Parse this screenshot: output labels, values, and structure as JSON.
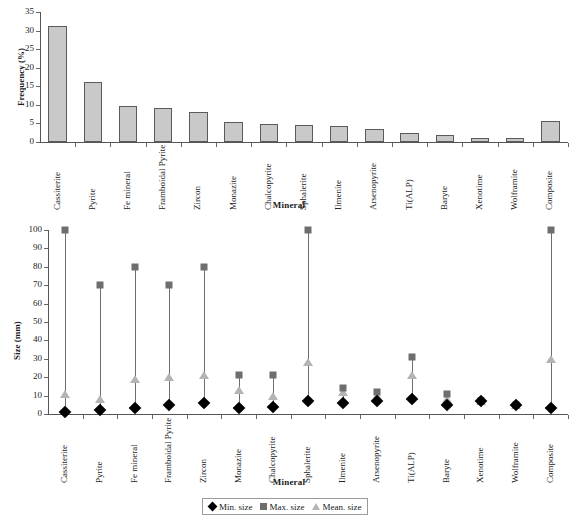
{
  "figure": {
    "panels": [
      {
        "id": "frequency-panel",
        "ylabel": "Frequency  (%)",
        "xlabel": "Mineral"
      },
      {
        "id": "size-panel",
        "ylabel": "Size (mm)",
        "xlabel": "Mineral"
      }
    ],
    "legend": {
      "items": [
        {
          "marker": "diamond",
          "label": "Min. size",
          "color": "#000000"
        },
        {
          "marker": "square",
          "label": "Max. size",
          "color": "#6e6e6e"
        },
        {
          "marker": "triangle",
          "label": "Mean. size",
          "color": "#b4b4b4"
        }
      ]
    },
    "colors": {
      "bar_fill": "#c9c9c9",
      "bar_stroke": "#5b5b5b",
      "min_size": "#000000",
      "max_size": "#6e6e6e",
      "mean_size": "#b4b4b4",
      "axis": "#555555"
    }
  },
  "chart_data": [
    {
      "type": "bar",
      "title": "",
      "xlabel": "Mineral",
      "ylabel": "Frequency  (%)",
      "ylim": [
        0,
        35
      ],
      "yticks": [
        0,
        5,
        10,
        15,
        20,
        25,
        30,
        35
      ],
      "ytick_labels": [
        "0",
        "5",
        "10",
        "15",
        "20",
        "25",
        "30",
        "35"
      ],
      "grid": false,
      "legend_position": "none",
      "categories": [
        "Cassiterite",
        "Pyrite",
        "Fe mineral",
        "Framboidal Pyrite",
        "Zircon",
        "Monazite",
        "Chalcopyrite",
        "Sphalerite",
        "Ilmenite",
        "Arsenopyrite",
        "Ti(ALP)",
        "Baryte",
        "Xenotime",
        "Wolframite",
        "Composite"
      ],
      "values": [
        31.3,
        16.1,
        9.7,
        9.2,
        8.1,
        5.4,
        4.9,
        4.5,
        4.2,
        3.6,
        2.4,
        1.9,
        1.1,
        1.1,
        5.7
      ]
    },
    {
      "type": "scatter",
      "title": "",
      "xlabel": "Mineral",
      "ylabel": "Size (mm)",
      "ylim": [
        0,
        100
      ],
      "yticks": [
        0,
        10,
        20,
        30,
        40,
        50,
        60,
        70,
        80,
        90,
        100
      ],
      "ytick_labels": [
        "0",
        "10",
        "20",
        "30",
        "40",
        "50",
        "60",
        "70",
        "80",
        "90",
        "100"
      ],
      "grid": false,
      "legend_position": "bottom",
      "categories": [
        "Cassiterite",
        "Pyrite",
        "Fe mineral",
        "Framboidal Pyrite",
        "Zircon",
        "Monazite",
        "Chalcopyrite",
        "Sphalerite",
        "Ilmenite",
        "Arsenopyrite",
        "Ti(ALP)",
        "Baryte",
        "Xenotime",
        "Wolframite",
        "Composite"
      ],
      "series": [
        {
          "name": "Min. size",
          "values": [
            1,
            2,
            3,
            5,
            6,
            3,
            4,
            7,
            6,
            7,
            8,
            5,
            7,
            5,
            3
          ]
        },
        {
          "name": "Max. size",
          "values": [
            100,
            70,
            80,
            70,
            80,
            21,
            21,
            100,
            14,
            12,
            31,
            11,
            7,
            5,
            100
          ]
        },
        {
          "name": "Mean. size",
          "values": [
            11,
            8,
            19,
            20,
            21,
            13,
            10,
            28,
            12,
            10,
            21,
            8,
            7,
            5,
            30
          ]
        }
      ]
    }
  ]
}
